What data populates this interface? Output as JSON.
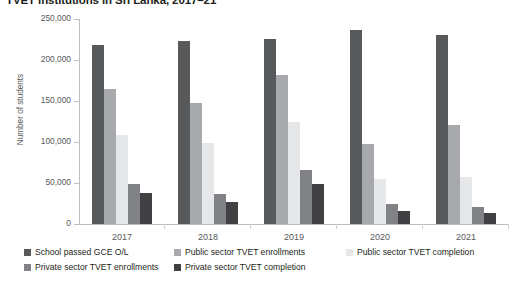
{
  "chart_data": {
    "type": "bar",
    "title": "TVET institutions in Sri Lanka, 2017–21",
    "xlabel": "",
    "ylabel": "Number of students",
    "categories": [
      "2017",
      "2018",
      "2019",
      "2020",
      "2021"
    ],
    "ylim": [
      0,
      250000
    ],
    "yticks": [
      0,
      50000,
      100000,
      150000,
      200000,
      250000
    ],
    "ytick_labels": [
      "0",
      "50,000",
      "100,000",
      "150,000",
      "200,000",
      "250,000"
    ],
    "grid": false,
    "legend_position": "bottom",
    "series": [
      {
        "name": "School passed GCE O/L",
        "color": "#58595b",
        "values": [
          218000,
          223000,
          226000,
          236000,
          231000
        ]
      },
      {
        "name": "Public sector TVET enrollments",
        "color": "#a7a9ac",
        "values": [
          165000,
          147000,
          182000,
          97000,
          121000
        ]
      },
      {
        "name": "Public sector TVET completion",
        "color": "#e6e7e8",
        "values": [
          108000,
          99000,
          124000,
          55000,
          57000
        ]
      },
      {
        "name": "Private sector TVET enrollments",
        "color": "#808285",
        "values": [
          49000,
          36000,
          66000,
          25000,
          21000
        ]
      },
      {
        "name": "Private sector TVET completion",
        "color": "#414042",
        "values": [
          38000,
          27000,
          49000,
          16000,
          13000
        ]
      }
    ]
  },
  "legend": {
    "row1": [
      "School passed GCE O/L",
      "Public sector TVET enrollments",
      "Public sector TVET completion"
    ],
    "row2": [
      "Private sector TVET enrollments",
      "Private sector TVET completion"
    ]
  }
}
